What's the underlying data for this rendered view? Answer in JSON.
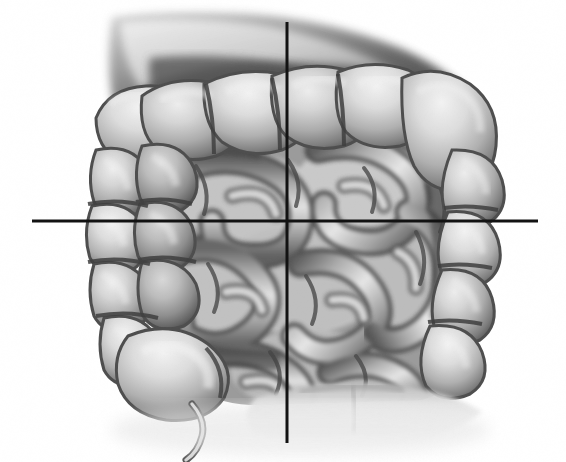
{
  "image": {
    "kind": "medical-illustration",
    "subject": "Abdominal intestines — large intestine (colon) frame surrounding coiled small intestine",
    "style": "grayscale airbrush / pencil-shaded anatomical drawing",
    "background_color": "#ffffff",
    "width": 566,
    "height": 462
  },
  "palette": {
    "background": "#ffffff",
    "line_black": "#121212",
    "tissue_light": "#dedede",
    "tissue_mid": "#a8a8a8",
    "tissue_shadow": "#6f6f6f",
    "tissue_deep_shadow": "#3d3d3d",
    "organ_top_shadow": "#4a4a4a"
  },
  "overlay": {
    "name": "abdominal-quadrant-crosshair",
    "line_color": "#121212",
    "line_width_px": 3,
    "intersection": {
      "x": 287,
      "y": 222
    },
    "horizontal_line": {
      "x1": 32,
      "x2": 538,
      "y": 221
    },
    "vertical_line": {
      "x": 287,
      "y1": 22,
      "y2": 443
    },
    "quadrants": [
      {
        "id": "upper-left",
        "label": ""
      },
      {
        "id": "upper-right",
        "label": ""
      },
      {
        "id": "lower-left",
        "label": ""
      },
      {
        "id": "lower-right",
        "label": ""
      }
    ]
  },
  "anatomy": {
    "structures": [
      {
        "name": "transverse-colon",
        "region": "upper-center"
      },
      {
        "name": "hepatic-flexure",
        "region": "upper-right"
      },
      {
        "name": "splenic-flexure",
        "region": "upper-left"
      },
      {
        "name": "ascending-colon",
        "region": "right"
      },
      {
        "name": "descending-colon",
        "region": "left"
      },
      {
        "name": "cecum",
        "region": "lower-left"
      },
      {
        "name": "appendix",
        "region": "lower-left"
      },
      {
        "name": "small-intestine-coils",
        "region": "center"
      },
      {
        "name": "sigmoid-colon",
        "region": "lower-right"
      },
      {
        "name": "stomach-shadow",
        "region": "top"
      }
    ]
  }
}
